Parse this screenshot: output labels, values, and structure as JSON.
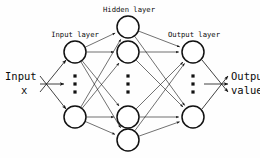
{
  "diagram": {
    "title_labels": {
      "hidden_layer": "Hidden layer",
      "input_layer": "Input layer",
      "output_layer": "Output layer"
    },
    "side_labels": {
      "input_line1": "Input",
      "input_line2": "x",
      "output_line1": "Output",
      "output_line2": "value"
    },
    "colors": {
      "stroke": "#111111",
      "node_fill": "#ffffff",
      "background": "#fefefe",
      "text": "#0b0b0b"
    },
    "node_radius": 11,
    "ellipsis_glyph": "⋮",
    "layers": [
      {
        "name": "input-layer",
        "label": "Input layer",
        "x": 75,
        "nodes_y": [
          52,
          117
        ],
        "ellipsis_y": 84,
        "has_ellipsis": true
      },
      {
        "name": "hidden-layer",
        "label": "Hidden layer",
        "x": 128,
        "nodes_y": [
          27,
          52,
          117,
          140
        ],
        "ellipsis_y": 84,
        "has_ellipsis": true
      },
      {
        "name": "output-layer",
        "label": "Output layer",
        "x": 193,
        "nodes_y": [
          52,
          117
        ],
        "ellipsis_y": 84,
        "has_ellipsis": true
      }
    ],
    "input_arrows": [
      {
        "x1": 40,
        "y1": 92,
        "x2": 66,
        "y2": 60
      },
      {
        "x1": 40,
        "y1": 84,
        "x2": 64,
        "y2": 84
      },
      {
        "x1": 40,
        "y1": 76,
        "x2": 66,
        "y2": 109
      }
    ],
    "output_arrows": [
      {
        "x1": 202,
        "y1": 60,
        "x2": 228,
        "y2": 92
      },
      {
        "x1": 204,
        "y1": 84,
        "x2": 228,
        "y2": 84
      },
      {
        "x1": 202,
        "y1": 109,
        "x2": 228,
        "y2": 76
      }
    ],
    "connections_note": "fully-connected mesh between adjacent layers, arrowheads pointing right"
  }
}
